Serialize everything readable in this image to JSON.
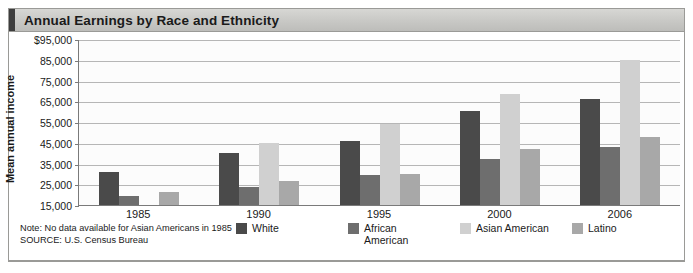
{
  "header": {
    "title": "Annual Earnings by Race and Ethnicity"
  },
  "axes": {
    "y_title": "Mean annual income",
    "y_ticks": [
      "$95,000",
      "85,000",
      "75,000",
      "65,000",
      "55,000",
      "45,000",
      "35,000",
      "25,000",
      "15,000"
    ],
    "x_ticks": [
      "1985",
      "1990",
      "1995",
      "2000",
      "2006"
    ]
  },
  "legend": {
    "items": [
      {
        "label": "White",
        "color": "#4a4a4a"
      },
      {
        "label": "African American",
        "color": "#6e6e6e"
      },
      {
        "label": "Asian American",
        "color": "#d0d0d0"
      },
      {
        "label": "Latino",
        "color": "#a8a8a8"
      }
    ]
  },
  "footer": {
    "note": "Note: No data available for Asian Americans in 1985",
    "source_label": "SOURCE:",
    "source_value": "U.S. Census Bureau"
  },
  "chart_data": {
    "type": "bar",
    "title": "Annual Earnings by Race and Ethnicity",
    "xlabel": "",
    "ylabel": "Mean annual income",
    "ylim": [
      15000,
      95000
    ],
    "ytick_values": [
      95000,
      85000,
      75000,
      65000,
      55000,
      45000,
      35000,
      25000,
      15000
    ],
    "grid": true,
    "legend_position": "bottom",
    "categories": [
      "1985",
      "1990",
      "1995",
      "2000",
      "2006"
    ],
    "series": [
      {
        "name": "White",
        "color": "#4a4a4a",
        "values": [
          31000,
          40000,
          46000,
          60500,
          66000
        ]
      },
      {
        "name": "African American",
        "color": "#6e6e6e",
        "values": [
          19500,
          23500,
          29500,
          37000,
          43000
        ]
      },
      {
        "name": "Asian American",
        "color": "#d0d0d0",
        "values": [
          null,
          45000,
          54000,
          68500,
          85000
        ]
      },
      {
        "name": "Latino",
        "color": "#a8a8a8",
        "values": [
          21500,
          26500,
          30000,
          42000,
          48000
        ]
      }
    ],
    "notes": [
      "Note: No data available for Asian Americans in 1985",
      "SOURCE: U.S. Census Bureau"
    ]
  }
}
